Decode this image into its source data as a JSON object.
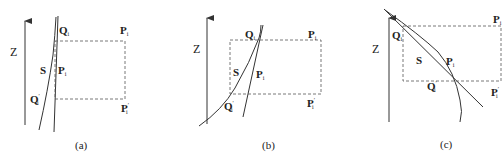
{
  "figure": {
    "panels": [
      {
        "id": "a",
        "caption": "(a)",
        "axis_label": "Z",
        "labels": {
          "Q": "Q",
          "Q_sub": "i",
          "P_top": "P",
          "P_top_sub": "i",
          "S": "S",
          "P_mid": "P",
          "P_mid_sub": "i",
          "Qp": "Q",
          "Qp_prime": "′",
          "Qp_sub": "i",
          "Pp": "P",
          "Pp_prime": "′",
          "Pp_sub": "i"
        }
      },
      {
        "id": "b",
        "caption": "(b)",
        "axis_label": "Z",
        "labels": {
          "Q": "Q",
          "Q_sub": "i",
          "P_top": "P",
          "P_top_sub": "i",
          "S": "S",
          "P_mid": "P",
          "P_mid_sub": "i",
          "Qp": "Q",
          "Qp_prime": "′",
          "Qp_sub": "i",
          "Pp": "P",
          "Pp_prime": "′",
          "Pp_sub": "i"
        }
      },
      {
        "id": "c",
        "caption": "(c)",
        "axis_label": "Z",
        "labels": {
          "Q": "Q",
          "Q_sub": "i",
          "P_top": "P",
          "P_top_sub": "i",
          "S": "S",
          "P_mid": "P",
          "P_mid_sub": "i",
          "Qp": "Q",
          "Qp_prime": "′",
          "Qp_sub": "i",
          "Pp": "P",
          "Pp_prime": "′",
          "Pp_sub": "i"
        }
      }
    ]
  }
}
